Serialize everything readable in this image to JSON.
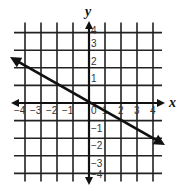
{
  "chart_data": {
    "type": "line",
    "title": "",
    "xlabel": "x",
    "ylabel": "y",
    "xlim": [
      -4,
      4
    ],
    "ylim": [
      -4,
      4
    ],
    "grid": true,
    "x_ticks": [
      "-4",
      "-3",
      "-2",
      "-1",
      "0",
      "1",
      "2",
      "3",
      "4"
    ],
    "y_ticks": [
      "4",
      "3",
      "2",
      "1",
      "-1",
      "-2",
      "-3",
      "-4"
    ],
    "series": [
      {
        "name": "line",
        "equation": "y = -1/2 x",
        "slope": -0.5,
        "intercept": 0,
        "points": [
          [
            -5,
            2.5
          ],
          [
            0,
            0
          ],
          [
            4.5,
            -2.25
          ]
        ],
        "arrows_both_ends": true
      }
    ]
  },
  "labels": {
    "x_axis": "x",
    "y_axis": "y"
  },
  "colors": {
    "grid": "#222222",
    "line": "#111111"
  }
}
